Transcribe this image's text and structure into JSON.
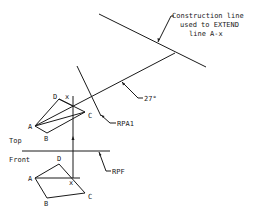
{
  "diagram": {
    "type": "descriptive-geometry-auxiliary-view",
    "annotations": {
      "construction_line_1": "Construction line",
      "construction_line_2": "used to EXTEND",
      "construction_line_3": "line A-x",
      "angle": "27°",
      "rpa1": "RPA1",
      "rpf": "RPF"
    },
    "view_labels": {
      "top": "Top",
      "front": "Front"
    },
    "top_view_points": {
      "A": "A",
      "B": "B",
      "C": "C",
      "D": "D",
      "x": "x"
    },
    "front_view_points": {
      "A": "A",
      "B": "B",
      "C": "C",
      "D": "D",
      "x": "x"
    },
    "colors": {
      "line": "#1a1a1a",
      "background": "#ffffff"
    }
  }
}
